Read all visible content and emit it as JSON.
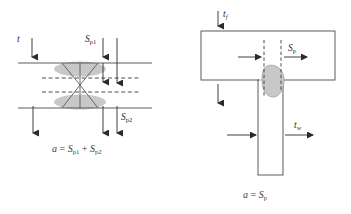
{
  "figure": {
    "background_color": "#ffffff",
    "line_color": "#4a4a4a",
    "arrow_color": "#2b2b2b",
    "weld_fill_color": "#c8c8c8",
    "weld_stroke_color": "#6e6e6e",
    "dashed_color": "#3a3a3a"
  },
  "left_diagram": {
    "name": "butt-joint-cross-section",
    "labels": {
      "thickness": {
        "symbol": "t",
        "subscript": ""
      },
      "penetration_top": {
        "symbol": "S",
        "subscript": "p1"
      },
      "penetration_bottom": {
        "symbol": "S",
        "subscript": "p2"
      }
    },
    "formula": {
      "lhs": "a",
      "equals": "=",
      "term1_symbol": "S",
      "term1_sub": "p1",
      "plus": "+",
      "term2_symbol": "S",
      "term2_sub": "p2",
      "plain": "a = Sp1 + Sp2"
    }
  },
  "right_diagram": {
    "name": "tee-joint-cross-section",
    "labels": {
      "flange_thickness": {
        "symbol": "t",
        "subscript": "f"
      },
      "penetration": {
        "symbol": "S",
        "subscript": "p"
      },
      "web_thickness": {
        "symbol": "t",
        "subscript": "w"
      }
    },
    "formula": {
      "lhs": "a",
      "equals": "=",
      "term1_symbol": "S",
      "term1_sub": "p",
      "plain": "a = Sp"
    }
  }
}
